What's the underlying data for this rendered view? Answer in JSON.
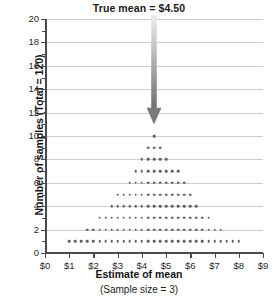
{
  "chart_data": {
    "type": "bar",
    "title": "True mean  =  $4.50",
    "xlabel": "Estimate of mean",
    "xsublabel": "(Sample size = 3)",
    "ylabel": "Number of samples (Total = 120)",
    "xlim": [
      0,
      9
    ],
    "ylim": [
      0,
      20
    ],
    "grid": true,
    "legend": "none",
    "x_tick_labels": [
      "$0",
      "$1",
      "$2",
      "$3",
      "$4",
      "$5",
      "$6",
      "$7",
      "$8",
      "$9"
    ],
    "x_tick_values": [
      0,
      1,
      2,
      3,
      4,
      5,
      6,
      7,
      8,
      9
    ],
    "y_tick_labels": [
      "0",
      "2",
      "4",
      "6",
      "8",
      "10",
      "12",
      "14",
      "16",
      "18",
      "20"
    ],
    "y_tick_values": [
      0,
      2,
      4,
      6,
      8,
      10,
      12,
      14,
      16,
      18,
      20
    ],
    "y_minor_tick_values": [
      1,
      3,
      5,
      7,
      9,
      11,
      13,
      15,
      17,
      19
    ],
    "bin_width": 0.25,
    "dot_color": "#5d6068",
    "grid_color": "#c9cdd2",
    "axis_color": "#4a4a4a",
    "annotation": {
      "label": "True mean  =  $4.50",
      "value": 4.5,
      "arrow_from_y": 20,
      "arrow_to_y": 11,
      "arrow_color_top": "#e2e2e2",
      "arrow_color_bottom": "#6f6f6f"
    },
    "categories": [
      1.0,
      1.25,
      1.5,
      1.75,
      2.0,
      2.25,
      2.5,
      2.75,
      3.0,
      3.25,
      3.5,
      3.75,
      4.0,
      4.25,
      4.5,
      4.75,
      5.0,
      5.25,
      5.5,
      5.75,
      6.0,
      6.25,
      6.5,
      6.75,
      7.0,
      7.25,
      7.5,
      7.75,
      8.0
    ],
    "values": [
      1,
      1,
      1,
      2,
      2,
      3,
      3,
      4,
      5,
      5,
      6,
      7,
      8,
      9,
      10,
      9,
      8,
      7,
      7,
      6,
      5,
      4,
      3,
      3,
      2,
      2,
      1,
      1,
      1
    ]
  }
}
